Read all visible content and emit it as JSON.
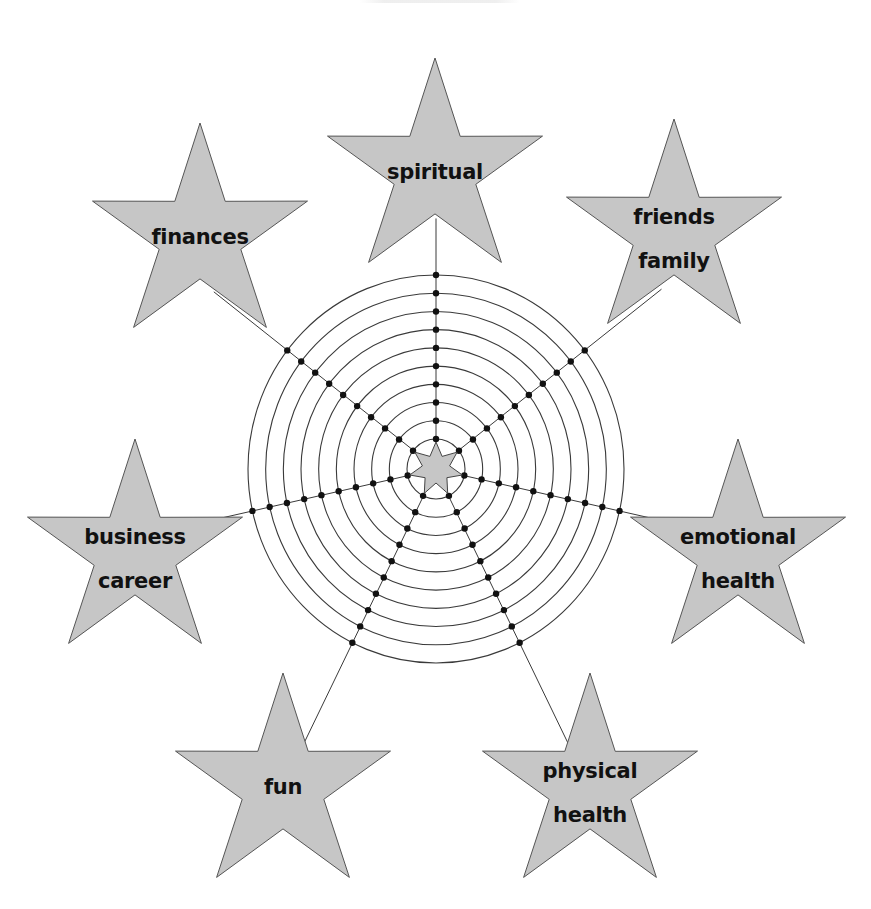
{
  "diagram": {
    "type": "wheel-of-life",
    "center": {
      "x": 436,
      "y": 469
    },
    "rings": {
      "count": 10,
      "inner_radius_x": 29,
      "outer_radius_x": 188,
      "inner_radius_y": 30,
      "outer_radius_y": 194
    },
    "center_star_points": 7,
    "spoke_count": 7,
    "colors": {
      "star_fill": "#c6c6c6",
      "star_stroke": "#555555",
      "line": "#3a3a3a",
      "dot": "#111111",
      "text": "#111111",
      "background": "#ffffff"
    },
    "categories": [
      {
        "id": "spiritual",
        "lines": [
          "spiritual"
        ],
        "star": {
          "cx": 435,
          "cy": 171,
          "r": 113
        },
        "spoke_angle_deg": 0
      },
      {
        "id": "friends-family",
        "lines": [
          "friends",
          "family"
        ],
        "star": {
          "cx": 674,
          "cy": 232,
          "r": 113
        },
        "spoke_angle_deg": 51.43
      },
      {
        "id": "emotional-health",
        "lines": [
          "emotional",
          "health"
        ],
        "star": {
          "cx": 738,
          "cy": 552,
          "r": 113
        },
        "spoke_angle_deg": 102.86
      },
      {
        "id": "physical-health",
        "lines": [
          "physical",
          "health"
        ],
        "star": {
          "cx": 590,
          "cy": 786,
          "r": 113
        },
        "spoke_angle_deg": 154.29
      },
      {
        "id": "fun",
        "lines": [
          "fun"
        ],
        "star": {
          "cx": 283,
          "cy": 786,
          "r": 113
        },
        "spoke_angle_deg": 205.71
      },
      {
        "id": "business-career",
        "lines": [
          "business",
          "career"
        ],
        "star": {
          "cx": 135,
          "cy": 552,
          "r": 113
        },
        "spoke_angle_deg": 257.14
      },
      {
        "id": "finances",
        "lines": [
          "finances"
        ],
        "star": {
          "cx": 200,
          "cy": 236,
          "r": 113
        },
        "spoke_angle_deg": 308.57
      }
    ]
  }
}
